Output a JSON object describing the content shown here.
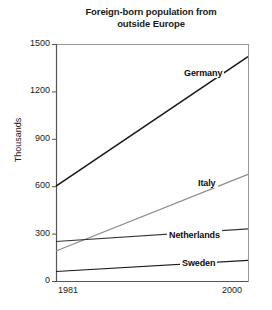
{
  "chart_data": {
    "type": "line",
    "title": "Foreign-born population from outside Europe",
    "title_line_1": "Foreign-born population from",
    "title_line_2": "outside Europe",
    "xlabel": "",
    "ylabel": "Thousands",
    "x": [
      1981,
      2000
    ],
    "x_tick_labels": [
      "1981",
      "2000"
    ],
    "xlim": [
      1981,
      2000
    ],
    "ylim": [
      0,
      1500
    ],
    "y_tick_labels": [
      "0",
      "300",
      "600",
      "900",
      "1200",
      "1500"
    ],
    "y_ticks": [
      0,
      300,
      600,
      900,
      1200,
      1500
    ],
    "grid": false,
    "legend": "inline-labels",
    "series": [
      {
        "name": "Germany",
        "values": [
          600,
          1420
        ],
        "color": "#1a1a1a",
        "width": 1.6,
        "label_x": 182,
        "label_y": 68
      },
      {
        "name": "Italy",
        "values": [
          190,
          675
        ],
        "color": "#8c8c8c",
        "width": 1.2,
        "label_x": 196,
        "label_y": 178
      },
      {
        "name": "Netherlands",
        "values": [
          250,
          330
        ],
        "color": "#333333",
        "width": 1.1,
        "label_x": 167,
        "label_y": 230
      },
      {
        "name": "Sweden",
        "values": [
          60,
          130
        ],
        "color": "#1a1a1a",
        "width": 1.2,
        "label_x": 180,
        "label_y": 258
      }
    ],
    "axis_color": "#555555",
    "frame_color": "#999999",
    "background": "#ffffff"
  }
}
